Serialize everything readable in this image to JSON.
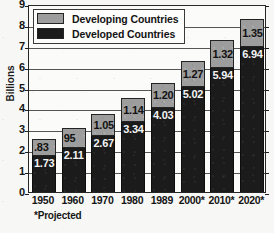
{
  "chart_data": {
    "type": "bar",
    "subtype": "stacked-vertical",
    "title": "",
    "xlabel": "",
    "ylabel": "Billions",
    "ylim": [
      0,
      9
    ],
    "yticks": [
      "0",
      "1",
      "2",
      "3",
      "4",
      "5",
      "6",
      "7",
      "8",
      "9"
    ],
    "grid": true,
    "legend_position": "top-left-inside",
    "categories": [
      "1950",
      "1960",
      "1970",
      "1980",
      "1989",
      "2000*",
      "2010*",
      "2020*"
    ],
    "series": [
      {
        "name": "Developed Countries",
        "color": "#1b1b1b",
        "values": [
          1.73,
          2.11,
          2.67,
          3.34,
          4.03,
          5.02,
          5.94,
          6.94
        ],
        "labels": [
          "1.73",
          "2.11",
          "2.67",
          "3.34",
          "4.03",
          "5.02",
          "5.94",
          "6.94"
        ]
      },
      {
        "name": "Developing Countries",
        "color": "#9d9d9d",
        "values": [
          0.83,
          0.95,
          1.05,
          1.14,
          1.2,
          1.27,
          1.32,
          1.35
        ],
        "labels": [
          ".83",
          "95",
          "1.05",
          "1.14",
          "1.20",
          "1.27",
          "1.32",
          "1.35"
        ]
      }
    ],
    "totals": [
      2.56,
      3.06,
      3.72,
      4.48,
      5.23,
      6.29,
      7.26,
      8.29
    ],
    "annotations": [
      "*Projected"
    ]
  },
  "legend": {
    "items": [
      {
        "label": "Developing Countries",
        "swatch": "gray"
      },
      {
        "label": "Developed Countries",
        "swatch": "black"
      }
    ]
  },
  "footnote": "*Projected"
}
